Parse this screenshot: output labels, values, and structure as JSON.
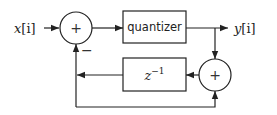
{
  "diagram": {
    "input_label": {
      "base": "x",
      "index": "[i]"
    },
    "output_label": {
      "base": "y",
      "index": "[i]"
    },
    "quantizer_label": "quantizer",
    "delay_label": {
      "base": "z",
      "exp": "−1"
    },
    "adder_left_symbol": "+",
    "adder_right_symbol": "+",
    "minus_sign": "−",
    "colors": {
      "stroke": "#222222",
      "background": "#ffffff"
    }
  }
}
